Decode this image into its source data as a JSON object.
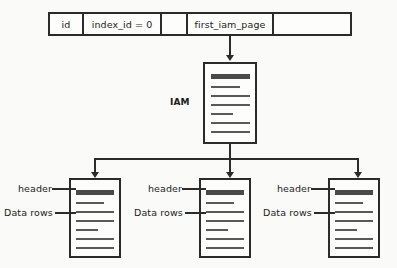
{
  "diagram": {
    "background_color": "#fafaf9",
    "line_color": "#2b2b2b",
    "row_table": {
      "name": "sysindexes-row",
      "cells": [
        {
          "label": "id"
        },
        {
          "label": "index_id = 0"
        },
        {
          "label": ""
        },
        {
          "label": "first_iam_page"
        },
        {
          "label": ""
        }
      ]
    },
    "iam_page": {
      "label": "IAM",
      "icon": "page-icon"
    },
    "data_pages": [
      {
        "header_label": "header",
        "rows_label": "Data rows",
        "icon": "page-icon"
      },
      {
        "header_label": "header",
        "rows_label": "Data rows",
        "icon": "page-icon"
      },
      {
        "header_label": "header",
        "rows_label": "Data rows",
        "icon": "page-icon"
      }
    ]
  }
}
